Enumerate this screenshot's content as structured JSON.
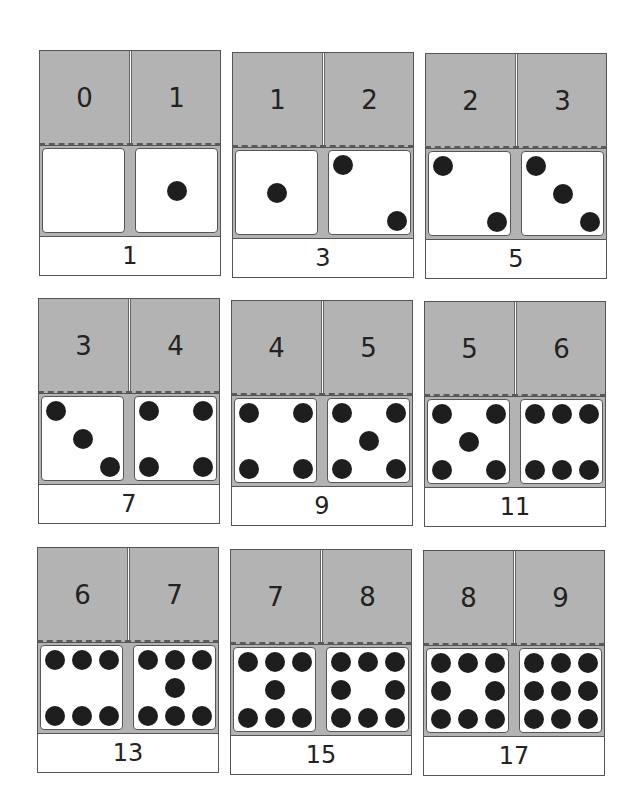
{
  "cards": [
    {
      "left": 0,
      "right": 1,
      "sum": "1"
    },
    {
      "left": 1,
      "right": 2,
      "sum": "3"
    },
    {
      "left": 2,
      "right": 3,
      "sum": "5"
    },
    {
      "left": 3,
      "right": 4,
      "sum": "7"
    },
    {
      "left": 4,
      "right": 5,
      "sum": "9"
    },
    {
      "left": 5,
      "right": 6,
      "sum": "11"
    },
    {
      "left": 6,
      "right": 7,
      "sum": "13"
    },
    {
      "left": 7,
      "right": 8,
      "sum": "15"
    },
    {
      "left": 8,
      "right": 9,
      "sum": "17"
    }
  ],
  "labels": {
    "n0": "0",
    "n1": "1",
    "n2": "2",
    "n3": "3",
    "n4": "4",
    "n5": "5",
    "n6": "6",
    "n7": "7",
    "n8": "8",
    "n9": "9"
  },
  "colors": {
    "card_gray": "#b3b3b3",
    "pip": "#1e1e1e",
    "border": "#555555",
    "face": "#ffffff"
  }
}
